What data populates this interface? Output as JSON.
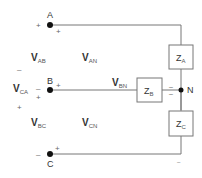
{
  "diagram": {
    "type": "three-phase wye-connected load circuit",
    "colors": {
      "wire": "#777777",
      "node": "#111111",
      "text": "#333333",
      "box_stroke": "#777777"
    },
    "terminals": [
      {
        "id": "A",
        "label": "A"
      },
      {
        "id": "B",
        "label": "B"
      },
      {
        "id": "C",
        "label": "C"
      },
      {
        "id": "N",
        "label": "N"
      }
    ],
    "impedances": [
      {
        "id": "ZA",
        "main": "Z",
        "sub": "A"
      },
      {
        "id": "ZB",
        "main": "Z",
        "sub": "B"
      },
      {
        "id": "ZC",
        "main": "Z",
        "sub": "C"
      }
    ],
    "voltages": [
      {
        "id": "VAB",
        "main": "V",
        "sub": "AB"
      },
      {
        "id": "VCA",
        "main": "V",
        "sub": "CA"
      },
      {
        "id": "VBC",
        "main": "V",
        "sub": "BC"
      },
      {
        "id": "VAN",
        "main": "V",
        "sub": "AN"
      },
      {
        "id": "VBN",
        "main": "V",
        "sub": "BN"
      },
      {
        "id": "VCN",
        "main": "V",
        "sub": "CN"
      }
    ],
    "signs": {
      "plus": "+",
      "minus": "–"
    }
  }
}
